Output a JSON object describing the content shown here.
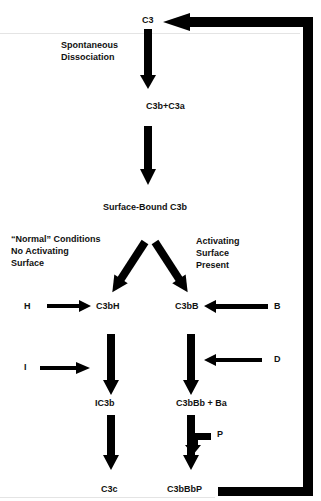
{
  "diagram": {
    "nodes": {
      "c3": "C3",
      "c3b_c3a": "C3b+C3a",
      "surface_bound": "Surface-Bound C3b",
      "c3bh": "C3bH",
      "c3bb": "C3bB",
      "ic3b": "IC3b",
      "c3bbb_ba": "C3bBb + Ba",
      "c3c": "C3c",
      "c3bbbp": "C3bBbP"
    },
    "factors": {
      "h": "H",
      "b": "B",
      "i": "I",
      "d": "D",
      "p": "P"
    },
    "annotations": {
      "spontaneous_1": "Spontaneous",
      "spontaneous_2": "Dissociation",
      "normal_1": "“Normal” Conditions",
      "normal_2": "No Activating",
      "normal_3": "Surface",
      "activating_1": "Activating",
      "activating_2": "Surface",
      "activating_3": "Present"
    },
    "colors": {
      "arrow": "#000000",
      "text": "#111111",
      "background": "#ffffff"
    }
  }
}
